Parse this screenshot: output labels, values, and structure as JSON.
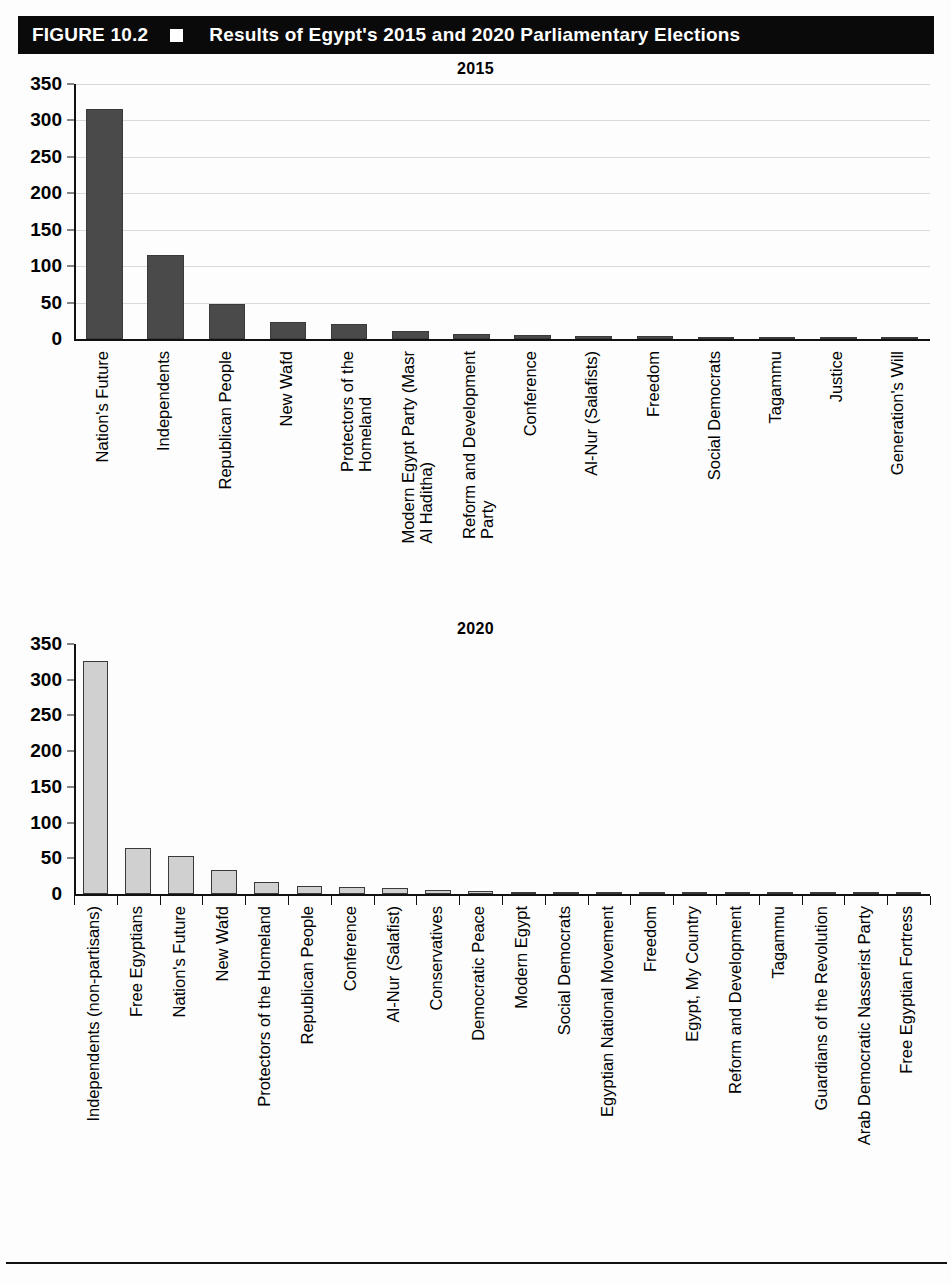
{
  "figure": {
    "label": "FIGURE 10.2",
    "bullet_icon": "white-square-icon",
    "title": "Results of Egypt's 2015 and 2020 Parliamentary Elections"
  },
  "colors": {
    "header_background": "#0a0a0a",
    "header_text": "#ffffff",
    "bar_2015": "#4a4a4a",
    "bar_2020": "#d0d0d0",
    "bar_outline": "#3a3a3a",
    "gridline": "#d9d9d9",
    "axis": "#111111"
  },
  "chart_data": [
    {
      "type": "bar",
      "title": "2015",
      "xlabel": "",
      "ylabel": "",
      "ylim": [
        0,
        350
      ],
      "yticks": [
        0,
        50,
        100,
        150,
        200,
        250,
        300,
        350
      ],
      "grid": true,
      "legend": "none",
      "bar_color": "#4a4a4a",
      "categories": [
        "Nation's Future",
        "Independents",
        "Republican People",
        "New Wafd",
        "Protectors of the\nHomeland",
        "Modern Egypt Party (Masr\nAl Haditha)",
        "Reform and Development\nParty",
        "Conference",
        "Al-Nur (Salafists)",
        "Freedom",
        "Social Democrats",
        "Tagammu",
        "Justice",
        "Generation's Will"
      ],
      "values": [
        316,
        116,
        48,
        23,
        21,
        11,
        7,
        5,
        4,
        4,
        3,
        3,
        1,
        1
      ]
    },
    {
      "type": "bar",
      "title": "2020",
      "xlabel": "",
      "ylabel": "",
      "ylim": [
        0,
        350
      ],
      "yticks": [
        0,
        50,
        100,
        150,
        200,
        250,
        300,
        350
      ],
      "grid": false,
      "legend": "none",
      "bar_color": "#d0d0d0",
      "categories": [
        "Independents (non-partisans)",
        "Free Egyptians",
        "Nation's Future",
        "New Wafd",
        "Protectors of the Homeland",
        "Republican People",
        "Conference",
        "Al-Nur (Salafist)",
        "Conservatives",
        "Democratic Peace",
        "Modern Egypt",
        "Social Democrats",
        "Egyptian National Movement",
        "Freedom",
        "Egypt, My Country",
        "Reform and Development",
        "Tagammu",
        "Guardians of the Revolution",
        "Arab Democratic Nasserist Party",
        "Free Egyptian Fortress"
      ],
      "values": [
        326,
        65,
        53,
        34,
        17,
        11,
        10,
        8,
        5,
        4,
        3,
        3,
        3,
        2,
        2,
        2,
        1,
        1,
        1,
        1
      ]
    }
  ]
}
